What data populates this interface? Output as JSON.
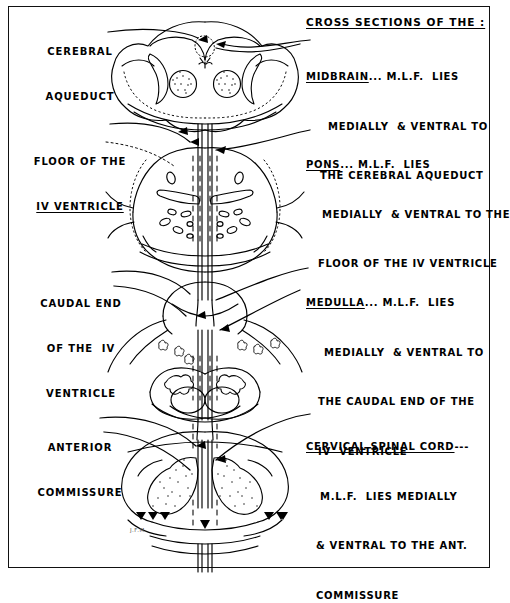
{
  "figure": {
    "kind": "hand-drawn neuroanatomy plate",
    "signature": "J.F.M."
  },
  "header": {
    "title": "CROSS SECTIONS OF THE :"
  },
  "right_annotations": [
    {
      "id": "midbrain",
      "term": "MIDBRAIN",
      "dots": "...",
      "lines": [
        "M.L.F.  LIES",
        "MEDIALLY  & VENTRAL TO",
        "THE CEREBRAL AQUEDUCT"
      ]
    },
    {
      "id": "pons",
      "term": "PONS",
      "dots": "...",
      "lines": [
        "M.L.F.  LIES",
        "MEDIALLY  & VENTRAL TO THE",
        "FLOOR OF THE IV VENTRICLE"
      ]
    },
    {
      "id": "medulla",
      "term": "MEDULLA",
      "dots": "...",
      "lines": [
        "M.L.F.  LIES",
        "MEDIALLY  & VENTRAL TO",
        "THE CAUDAL END OF THE",
        "IV  VENTRICLE"
      ]
    },
    {
      "id": "cervical-spinal-cord",
      "term": "CERVICAL SPINAL CORD",
      "dots": "---",
      "lines": [
        "M.L.F.  LIES MEDIALLY",
        "& VENTRAL TO THE ANT.",
        "COMMISSURE"
      ]
    }
  ],
  "left_labels": [
    {
      "id": "cerebral-aqueduct",
      "lines": [
        "CEREBRAL",
        "AQUEDUCT"
      ]
    },
    {
      "id": "floor-iv-ventricle",
      "lines": [
        "FLOOR OF THE",
        "IV VENTRICLE"
      ]
    },
    {
      "id": "caudal-end-iv-ventricle",
      "lines": [
        "CAUDAL END",
        "OF THE  IV",
        "VENTRICLE"
      ]
    },
    {
      "id": "anterior-commissure",
      "lines": [
        "ANTERIOR",
        "COMMISSURE"
      ]
    }
  ],
  "sections": [
    {
      "id": "midbrain-section",
      "label": "midbrain cross section"
    },
    {
      "id": "pons-section",
      "label": "pons cross section"
    },
    {
      "id": "medulla-section",
      "label": "medulla cross section"
    },
    {
      "id": "spinal-cord-section",
      "label": "cervical spinal cord cross section"
    }
  ],
  "colors": {
    "ink": "#000000",
    "paper": "#ffffff"
  }
}
